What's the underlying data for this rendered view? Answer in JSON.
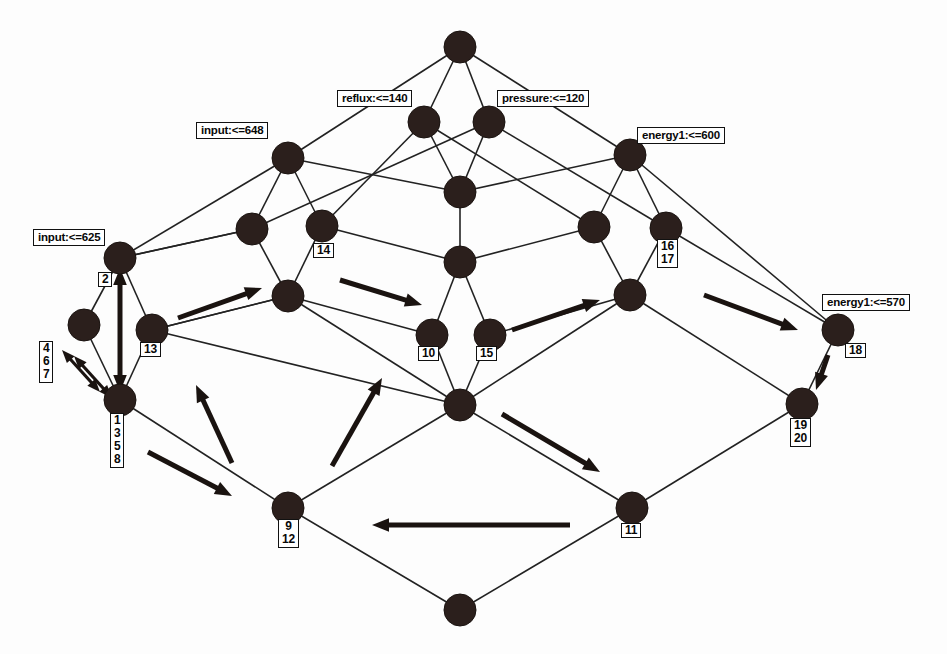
{
  "diagram": {
    "type": "concept-lattice-hasse-diagram",
    "title": "",
    "background_color": "#fdfdfd",
    "node_color": "#2b1f1c",
    "edge_color": "#222222",
    "arrow_color": "#1a1310"
  },
  "attribute_labels": [
    {
      "id": "attr-reflux-140",
      "text": "reflux:<=140",
      "x": 337,
      "y": 90,
      "node": "n-reflux"
    },
    {
      "id": "attr-pressure-120",
      "text": "pressure:<=120",
      "x": 497,
      "y": 90,
      "node": "n-pressure"
    },
    {
      "id": "attr-input-648",
      "text": "input:<=648",
      "x": 196,
      "y": 122,
      "node": "n-input648"
    },
    {
      "id": "attr-energy1-600",
      "text": "energy1:<=600",
      "x": 637,
      "y": 127,
      "node": "n-energy600"
    },
    {
      "id": "attr-input-625",
      "text": "input:<=625",
      "x": 33,
      "y": 229,
      "node": "n-input625"
    },
    {
      "id": "attr-energy1-570",
      "text": "energy1:<=570",
      "x": 822,
      "y": 294,
      "node": "n-energy570"
    }
  ],
  "object_labels": [
    {
      "id": "obj-2",
      "items": [
        "2"
      ],
      "x": 98,
      "y": 272
    },
    {
      "id": "obj-14",
      "items": [
        "14"
      ],
      "x": 313,
      "y": 243
    },
    {
      "id": "obj-16-17",
      "items": [
        "16",
        "17"
      ],
      "x": 657,
      "y": 239
    },
    {
      "id": "obj-13",
      "items": [
        "13"
      ],
      "x": 140,
      "y": 342
    },
    {
      "id": "obj-10",
      "items": [
        "10"
      ],
      "x": 418,
      "y": 346
    },
    {
      "id": "obj-15",
      "items": [
        "15"
      ],
      "x": 476,
      "y": 346
    },
    {
      "id": "obj-18",
      "items": [
        "18"
      ],
      "x": 845,
      "y": 343
    },
    {
      "id": "obj-4-6-7",
      "items": [
        "4",
        "6",
        "7"
      ],
      "x": 39,
      "y": 341
    },
    {
      "id": "obj-1-3-5-8",
      "items": [
        "1",
        "3",
        "5",
        "8"
      ],
      "x": 110,
      "y": 413
    },
    {
      "id": "obj-19-20",
      "items": [
        "19",
        "20"
      ],
      "x": 790,
      "y": 418
    },
    {
      "id": "obj-9-12",
      "items": [
        "9",
        "12"
      ],
      "x": 278,
      "y": 519
    },
    {
      "id": "obj-11",
      "items": [
        "11"
      ],
      "x": 621,
      "y": 523
    }
  ],
  "nodes": [
    {
      "id": "n-top",
      "x": 460,
      "y": 47,
      "r": 16
    },
    {
      "id": "n-reflux",
      "x": 424,
      "y": 122,
      "r": 16
    },
    {
      "id": "n-pressure",
      "x": 489,
      "y": 122,
      "r": 16
    },
    {
      "id": "n-input648",
      "x": 288,
      "y": 158,
      "r": 16
    },
    {
      "id": "n-energy600",
      "x": 630,
      "y": 155,
      "r": 16
    },
    {
      "id": "n-c-190",
      "x": 460,
      "y": 192,
      "r": 16
    },
    {
      "id": "n-l-228",
      "x": 252,
      "y": 229,
      "r": 16
    },
    {
      "id": "n-14",
      "x": 322,
      "y": 226,
      "r": 16
    },
    {
      "id": "n-r-227",
      "x": 594,
      "y": 227,
      "r": 16
    },
    {
      "id": "n-16-17",
      "x": 666,
      "y": 228,
      "r": 16
    },
    {
      "id": "n-input625",
      "x": 120,
      "y": 258,
      "r": 16
    },
    {
      "id": "n-c-262",
      "x": 460,
      "y": 262,
      "r": 16
    },
    {
      "id": "n-l-296",
      "x": 288,
      "y": 296,
      "r": 16
    },
    {
      "id": "n-r-295",
      "x": 630,
      "y": 295,
      "r": 16
    },
    {
      "id": "n-ll-325",
      "x": 84,
      "y": 325,
      "r": 16
    },
    {
      "id": "n-13",
      "x": 152,
      "y": 330,
      "r": 16
    },
    {
      "id": "n-10",
      "x": 432,
      "y": 335,
      "r": 16
    },
    {
      "id": "n-15",
      "x": 490,
      "y": 335,
      "r": 16
    },
    {
      "id": "n-energy570",
      "x": 838,
      "y": 330,
      "r": 16
    },
    {
      "id": "n-1-3-5-8",
      "x": 120,
      "y": 400,
      "r": 16
    },
    {
      "id": "n-c-405",
      "x": 460,
      "y": 405,
      "r": 16
    },
    {
      "id": "n-19-20",
      "x": 802,
      "y": 404,
      "r": 16
    },
    {
      "id": "n-9-12",
      "x": 288,
      "y": 508,
      "r": 16
    },
    {
      "id": "n-11",
      "x": 632,
      "y": 508,
      "r": 16
    },
    {
      "id": "n-bottom",
      "x": 460,
      "y": 610,
      "r": 16
    }
  ],
  "edges": [
    [
      "n-top",
      "n-reflux"
    ],
    [
      "n-top",
      "n-pressure"
    ],
    [
      "n-top",
      "n-input648"
    ],
    [
      "n-top",
      "n-energy600"
    ],
    [
      "n-reflux",
      "n-c-190"
    ],
    [
      "n-pressure",
      "n-c-190"
    ],
    [
      "n-reflux",
      "n-14"
    ],
    [
      "n-reflux",
      "n-r-227"
    ],
    [
      "n-pressure",
      "n-l-228"
    ],
    [
      "n-pressure",
      "n-16-17"
    ],
    [
      "n-input648",
      "n-l-228"
    ],
    [
      "n-input648",
      "n-14"
    ],
    [
      "n-input648",
      "n-c-190"
    ],
    [
      "n-input648",
      "n-input625"
    ],
    [
      "n-energy600",
      "n-r-227"
    ],
    [
      "n-energy600",
      "n-16-17"
    ],
    [
      "n-energy600",
      "n-c-190"
    ],
    [
      "n-energy600",
      "n-energy570"
    ],
    [
      "n-c-190",
      "n-c-262"
    ],
    [
      "n-l-228",
      "n-l-296"
    ],
    [
      "n-14",
      "n-l-296"
    ],
    [
      "n-l-228",
      "n-input625"
    ],
    [
      "n-14",
      "n-c-262"
    ],
    [
      "n-r-227",
      "n-c-262"
    ],
    [
      "n-r-227",
      "n-r-295"
    ],
    [
      "n-16-17",
      "n-r-295"
    ],
    [
      "n-16-17",
      "n-energy570"
    ],
    [
      "n-input625",
      "n-ll-325"
    ],
    [
      "n-input625",
      "n-13"
    ],
    [
      "n-c-262",
      "n-10"
    ],
    [
      "n-c-262",
      "n-15"
    ],
    [
      "n-l-296",
      "n-10"
    ],
    [
      "n-l-296",
      "n-c-405"
    ],
    [
      "n-r-295",
      "n-15"
    ],
    [
      "n-r-295",
      "n-c-405"
    ],
    [
      "n-l-296",
      "n-13"
    ],
    [
      "n-ll-325",
      "n-1-3-5-8"
    ],
    [
      "n-13",
      "n-1-3-5-8"
    ],
    [
      "n-10",
      "n-c-405"
    ],
    [
      "n-15",
      "n-c-405"
    ],
    [
      "n-13",
      "n-c-405"
    ],
    [
      "n-energy570",
      "n-19-20"
    ],
    [
      "n-1-3-5-8",
      "n-9-12"
    ],
    [
      "n-c-405",
      "n-9-12"
    ],
    [
      "n-c-405",
      "n-11"
    ],
    [
      "n-19-20",
      "n-11"
    ],
    [
      "n-9-12",
      "n-bottom"
    ],
    [
      "n-11",
      "n-bottom"
    ],
    [
      "n-r-295",
      "n-19-20"
    ],
    [
      "n-13",
      "n-l-296"
    ],
    [
      "n-input625",
      "n-l-228"
    ]
  ],
  "arrows": [
    {
      "id": "arrow-up-2",
      "x1": 120,
      "y1": 392,
      "x2": 120,
      "y2": 268,
      "double": true,
      "weight": "heavy"
    },
    {
      "id": "arrow-diag-467-a",
      "x1": 100,
      "y1": 392,
      "x2": 62,
      "y2": 350,
      "double": true,
      "weight": "thin"
    },
    {
      "id": "arrow-diag-467-b",
      "x1": 112,
      "y1": 398,
      "x2": 74,
      "y2": 356,
      "double": true,
      "weight": "thin"
    },
    {
      "id": "arrow-13-to-14",
      "x1": 178,
      "y1": 318,
      "x2": 262,
      "y2": 288,
      "double": false,
      "weight": "heavy"
    },
    {
      "id": "arrow-14-to-10",
      "x1": 340,
      "y1": 280,
      "x2": 422,
      "y2": 305,
      "double": false,
      "weight": "heavy"
    },
    {
      "id": "arrow-15-to-16",
      "x1": 512,
      "y1": 330,
      "x2": 600,
      "y2": 300,
      "double": false,
      "weight": "heavy"
    },
    {
      "id": "arrow-16-to-18",
      "x1": 704,
      "y1": 295,
      "x2": 798,
      "y2": 330,
      "double": false,
      "weight": "heavy"
    },
    {
      "id": "arrow-18-to-19",
      "x1": 828,
      "y1": 355,
      "x2": 816,
      "y2": 390,
      "double": false,
      "weight": "heavy"
    },
    {
      "id": "arrow-9-to-13",
      "x1": 232,
      "y1": 463,
      "x2": 196,
      "y2": 385,
      "double": false,
      "weight": "heavy"
    },
    {
      "id": "arrow-9-to-center",
      "x1": 332,
      "y1": 466,
      "x2": 382,
      "y2": 378,
      "double": false,
      "weight": "heavy"
    },
    {
      "id": "arrow-1-to-9",
      "x1": 148,
      "y1": 452,
      "x2": 232,
      "y2": 496,
      "double": false,
      "weight": "heavy"
    },
    {
      "id": "arrow-center-to-11",
      "x1": 502,
      "y1": 414,
      "x2": 600,
      "y2": 472,
      "double": false,
      "weight": "heavy"
    },
    {
      "id": "arrow-11-to-9",
      "x1": 570,
      "y1": 525,
      "x2": 372,
      "y2": 525,
      "double": false,
      "weight": "heavy"
    }
  ]
}
